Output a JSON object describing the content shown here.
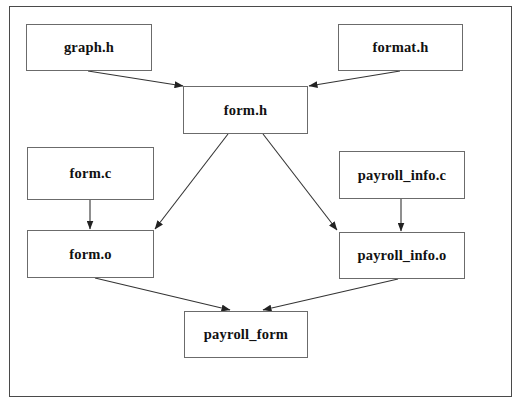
{
  "diagram": {
    "type": "dependency-graph",
    "background_color": "#ffffff",
    "frame": {
      "border_color": "#4a4a4a",
      "x": 9,
      "y": 6,
      "width": 503,
      "height": 391
    },
    "node_style": {
      "fill": "#ffffff",
      "border_color": "#6b6b6b",
      "text_color": "#111111"
    },
    "edge_color": "#333333",
    "nodes": [
      {
        "id": "graph_h",
        "label": "graph.h",
        "x": 26,
        "y": 24,
        "width": 126,
        "height": 47
      },
      {
        "id": "format_h",
        "label": "format.h",
        "x": 338,
        "y": 24,
        "width": 125,
        "height": 47
      },
      {
        "id": "form_h",
        "label": "form.h",
        "x": 183,
        "y": 86,
        "width": 125,
        "height": 48
      },
      {
        "id": "form_c",
        "label": "form.c",
        "x": 27,
        "y": 147,
        "width": 127,
        "height": 53
      },
      {
        "id": "payroll_info_c",
        "label": "payroll_info.c",
        "x": 339,
        "y": 151,
        "width": 126,
        "height": 48
      },
      {
        "id": "form_o",
        "label": "form.o",
        "x": 27,
        "y": 230,
        "width": 127,
        "height": 48
      },
      {
        "id": "payroll_info_o",
        "label": "payroll_info.o",
        "x": 339,
        "y": 232,
        "width": 126,
        "height": 47
      },
      {
        "id": "payroll_form",
        "label": "payroll_form",
        "x": 184,
        "y": 311,
        "width": 124,
        "height": 47
      }
    ],
    "edges": [
      {
        "id": "e1",
        "from": "graph.h",
        "to": "form.h",
        "x1": 88,
        "y1": 71,
        "x2": 183,
        "y2": 86
      },
      {
        "id": "e2",
        "from": "format.h",
        "to": "form.h",
        "x1": 400,
        "y1": 71,
        "x2": 309,
        "y2": 86
      },
      {
        "id": "e3",
        "from": "form.h",
        "to": "form.o",
        "x1": 228,
        "y1": 134,
        "x2": 155,
        "y2": 229
      },
      {
        "id": "e4",
        "from": "form.h",
        "to": "payroll_info.o",
        "x1": 263,
        "y1": 134,
        "x2": 337,
        "y2": 230
      },
      {
        "id": "e5",
        "from": "form.c",
        "to": "form.o",
        "x1": 90,
        "y1": 200,
        "x2": 90,
        "y2": 229
      },
      {
        "id": "e6",
        "from": "payroll_info.c",
        "to": "payroll_info.o",
        "x1": 401,
        "y1": 199,
        "x2": 401,
        "y2": 231
      },
      {
        "id": "e7",
        "from": "form.o",
        "to": "payroll_form",
        "x1": 95,
        "y1": 278,
        "x2": 230,
        "y2": 310
      },
      {
        "id": "e8",
        "from": "payroll_info.o",
        "to": "payroll_form",
        "x1": 398,
        "y1": 279,
        "x2": 263,
        "y2": 310
      }
    ]
  }
}
